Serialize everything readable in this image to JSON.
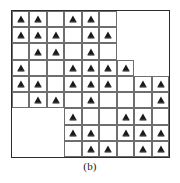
{
  "figure": {
    "caption": "(b)",
    "grid": {
      "rows": 9,
      "cols": 9,
      "frame_color": "#2b2b2b",
      "cell_border_color": "#6e6e6e",
      "marker_color": "#1a1a1a",
      "marker_name": "triangle-marker"
    }
  },
  "chart_data": {
    "type": "heatmap",
    "title": "(b)",
    "xlabel": "",
    "ylabel": "",
    "grid": true,
    "legend": "none",
    "rows": 9,
    "cols": 9,
    "x": [
      1,
      2,
      3,
      4,
      5,
      6,
      7,
      8,
      9
    ],
    "y": [
      1,
      2,
      3,
      4,
      5,
      6,
      7,
      8,
      9
    ],
    "marker_symbol": "triangle",
    "marker_rows": [
      [
        1,
        1,
        0,
        1,
        1,
        0,
        0,
        0,
        0
      ],
      [
        1,
        1,
        1,
        0,
        1,
        1,
        0,
        0,
        0
      ],
      [
        0,
        1,
        1,
        0,
        1,
        0,
        0,
        0,
        0
      ],
      [
        1,
        0,
        0,
        1,
        1,
        1,
        1,
        0,
        0
      ],
      [
        1,
        1,
        0,
        1,
        1,
        1,
        0,
        1,
        1
      ],
      [
        0,
        1,
        1,
        0,
        1,
        0,
        0,
        0,
        1
      ],
      [
        0,
        0,
        0,
        1,
        0,
        0,
        1,
        1,
        0
      ],
      [
        0,
        0,
        0,
        1,
        1,
        0,
        1,
        1,
        1
      ],
      [
        0,
        0,
        0,
        0,
        1,
        1,
        0,
        1,
        1
      ]
    ],
    "outline_rows": [
      [
        1,
        1,
        1,
        1,
        1,
        1,
        0,
        0,
        0
      ],
      [
        1,
        1,
        1,
        1,
        1,
        1,
        0,
        0,
        0
      ],
      [
        1,
        1,
        1,
        1,
        1,
        1,
        0,
        0,
        0
      ],
      [
        1,
        1,
        1,
        1,
        1,
        1,
        1,
        0,
        0
      ],
      [
        1,
        1,
        1,
        1,
        1,
        1,
        1,
        1,
        1
      ],
      [
        1,
        1,
        1,
        1,
        1,
        1,
        1,
        1,
        1
      ],
      [
        0,
        0,
        0,
        1,
        1,
        1,
        1,
        1,
        1
      ],
      [
        0,
        0,
        0,
        1,
        1,
        1,
        1,
        1,
        1
      ],
      [
        0,
        0,
        0,
        1,
        1,
        1,
        1,
        1,
        1
      ]
    ]
  }
}
